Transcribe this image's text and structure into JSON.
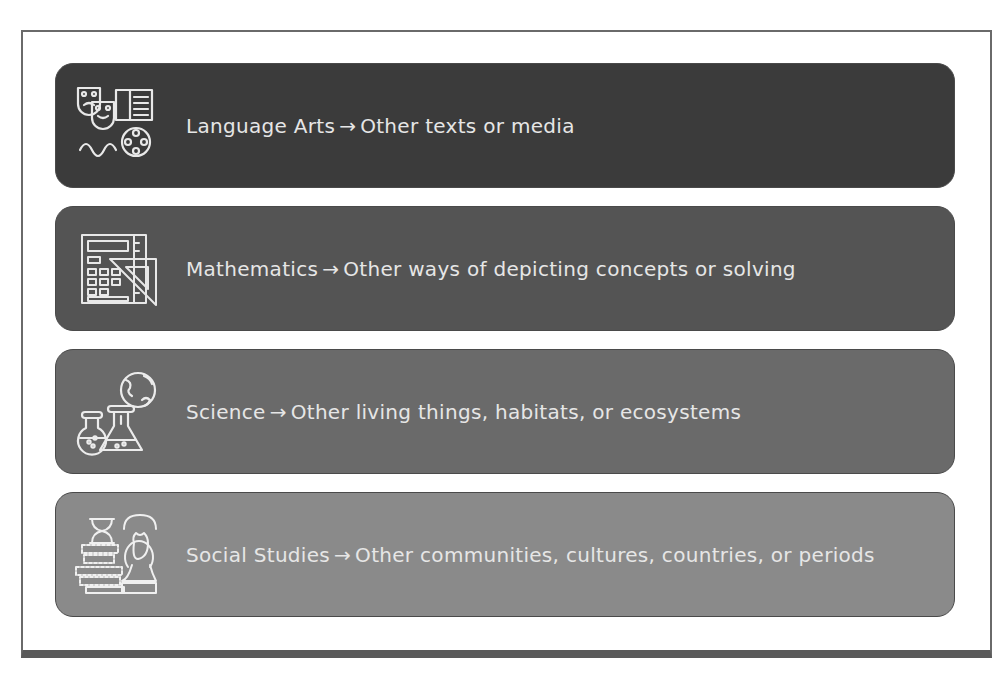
{
  "caption_fragment": "",
  "rows": [
    {
      "subject": "Language Arts",
      "arrow": "→",
      "target": "Other texts or media",
      "icon": "theater-masks-book-film-icon",
      "color": "#3b3b3b"
    },
    {
      "subject": "Mathematics",
      "arrow": "→",
      "target": "Other ways of depicting concepts or solving",
      "icon": "calculator-ruler-icon",
      "color": "#545454"
    },
    {
      "subject": "Science",
      "arrow": "→",
      "target": "Other living things, habitats, or ecosystems",
      "icon": "flasks-globe-icon",
      "color": "#6a6a6a"
    },
    {
      "subject": "Social Studies",
      "arrow": "→",
      "target": "Other communities, cultures, countries, or periods",
      "icon": "hourglass-books-bust-icon",
      "color": "#8a8a8a"
    }
  ]
}
